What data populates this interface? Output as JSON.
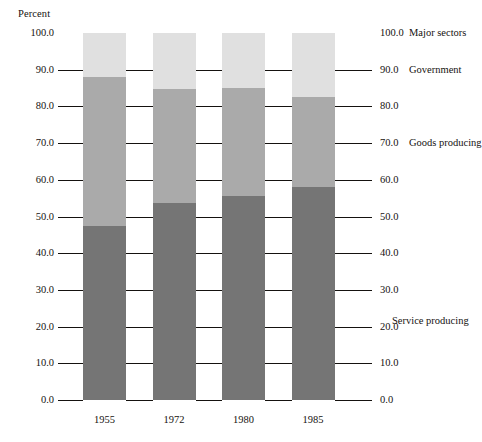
{
  "chart_data": {
    "type": "bar",
    "subtype": "stacked-bar",
    "title": "",
    "xlabel": "",
    "ylabel": "Percent",
    "ylim": [
      0,
      100
    ],
    "grid": false,
    "legend_position": "right-inline-annotations",
    "categories": [
      "1955",
      "1972",
      "1980",
      "1985"
    ],
    "series": [
      {
        "name": "Service producing",
        "color": "#757575",
        "values": [
          47.5,
          53.7,
          55.6,
          58.0
        ]
      },
      {
        "name": "Goods producing",
        "color": "#aaaaaa",
        "values": [
          40.5,
          31.0,
          29.3,
          24.6
        ]
      },
      {
        "name": "Government",
        "color": "#e0e0e0",
        "values": [
          12.0,
          15.3,
          15.1,
          17.4
        ]
      }
    ],
    "cumulative_tops": [
      {
        "category": "1955",
        "service": 47.5,
        "goods": 88.0,
        "government": 100.0
      },
      {
        "category": "1972",
        "service": 53.7,
        "goods": 84.7,
        "government": 100.0
      },
      {
        "category": "1980",
        "service": 55.6,
        "goods": 84.9,
        "government": 100.0
      },
      {
        "category": "1985",
        "service": 58.0,
        "goods": 82.6,
        "government": 100.0
      }
    ],
    "y_ticks": [
      100.0,
      90.0,
      80.0,
      70.0,
      60.0,
      50.0,
      40.0,
      30.0,
      20.0,
      10.0,
      0.0
    ],
    "y_tick_labels_left": [
      "100.0",
      "90.0",
      "80.0",
      "70.0",
      "60.0",
      "50.0",
      "40.0",
      "30.0",
      "20.0",
      "10.0",
      "0.0"
    ],
    "y_tick_labels_right": [
      "100.0",
      "90.0",
      "80.0",
      "70.0",
      "60.0",
      "50.0",
      "40.0",
      "30.0",
      "20.0",
      "10.0",
      "0.0"
    ],
    "annotations": [
      {
        "text": "Major sectors",
        "at_value": 100.0
      },
      {
        "text": "Government",
        "at_value": 90.0
      },
      {
        "text": "Goods producing",
        "at_value": 70.0
      },
      {
        "text": "Service producing",
        "at_value": 21.5
      }
    ]
  },
  "axis": {
    "percent_label": "Percent"
  },
  "colors": {
    "service_producing": "#757575",
    "goods_producing": "#aaaaaa",
    "government": "#e0e0e0",
    "ink": "#15120f",
    "background": "#ffffff"
  }
}
